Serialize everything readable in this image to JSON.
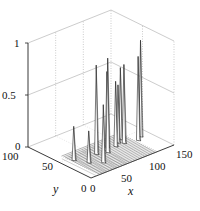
{
  "chart_data": {
    "type": "surface3d",
    "title": "",
    "xlabel": "x",
    "ylabel": "y",
    "zlabel": "",
    "xlim": [
      0,
      150
    ],
    "ylim": [
      0,
      100
    ],
    "zlim": [
      0,
      1
    ],
    "x_ticks": [
      "0",
      "50",
      "100",
      "150"
    ],
    "y_ticks": [
      "0",
      "50",
      "100"
    ],
    "z_ticks": [
      "0",
      "0.5",
      "1"
    ],
    "grid": true,
    "legend": null,
    "peaks": [
      {
        "x": 20,
        "y": 45,
        "z": 0.32
      },
      {
        "x": 30,
        "y": 30,
        "z": 0.3
      },
      {
        "x": 45,
        "y": 20,
        "z": 0.55
      },
      {
        "x": 55,
        "y": 40,
        "z": 0.85
      },
      {
        "x": 70,
        "y": 35,
        "z": 0.9
      },
      {
        "x": 80,
        "y": 45,
        "z": 0.72
      },
      {
        "x": 90,
        "y": 40,
        "z": 0.62
      },
      {
        "x": 100,
        "y": 45,
        "z": 0.55
      },
      {
        "x": 105,
        "y": 40,
        "z": 0.75
      },
      {
        "x": 110,
        "y": 50,
        "z": 0.68
      },
      {
        "x": 125,
        "y": 35,
        "z": 0.8
      },
      {
        "x": 135,
        "y": 40,
        "z": 0.92
      }
    ]
  },
  "axes": {
    "x_label": "x",
    "y_label": "y",
    "x_ticks": [
      "0",
      "50",
      "100",
      "150"
    ],
    "y_ticks": [
      "0",
      "50",
      "100"
    ],
    "z_ticks": [
      "0",
      "0.5",
      "1"
    ]
  }
}
